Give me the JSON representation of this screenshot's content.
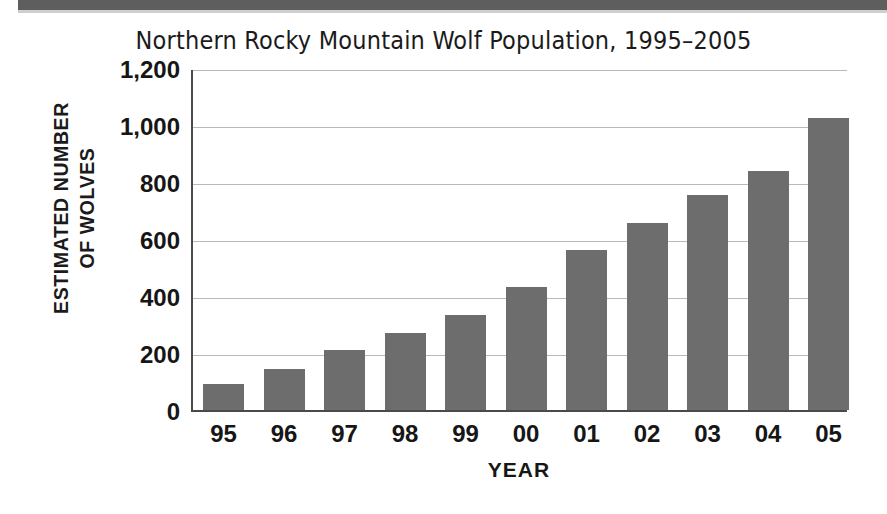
{
  "header": {
    "band_color": "#5e5e5e"
  },
  "chart": {
    "title": "Northern Rocky Mountain Wolf Population, 1995–2005",
    "y_axis_title_line1": "ESTIMATED NUMBER",
    "y_axis_title_line2": "OF WOLVES",
    "x_axis_title": "YEAR",
    "bar_color": "#6d6d6d",
    "gridline_color": "#b9b9b9",
    "axis_color": "#4a4a4a",
    "text_color": "#161616"
  },
  "chart_data": {
    "type": "bar",
    "title": "Northern Rocky Mountain Wolf Population, 1995–2005",
    "xlabel": "YEAR",
    "ylabel": "ESTIMATED NUMBER OF WOLVES",
    "categories": [
      "95",
      "96",
      "97",
      "98",
      "99",
      "00",
      "01",
      "02",
      "03",
      "04",
      "05"
    ],
    "values": [
      90,
      145,
      210,
      270,
      335,
      430,
      560,
      655,
      755,
      840,
      1025
    ],
    "ylim": [
      0,
      1200
    ],
    "ytick_values": [
      0,
      200,
      400,
      600,
      800,
      1000,
      1200
    ],
    "ytick_labels": [
      "0",
      "200",
      "400",
      "600",
      "800",
      "1,000",
      "1,200"
    ],
    "grid": "horizontal",
    "legend": "none"
  }
}
